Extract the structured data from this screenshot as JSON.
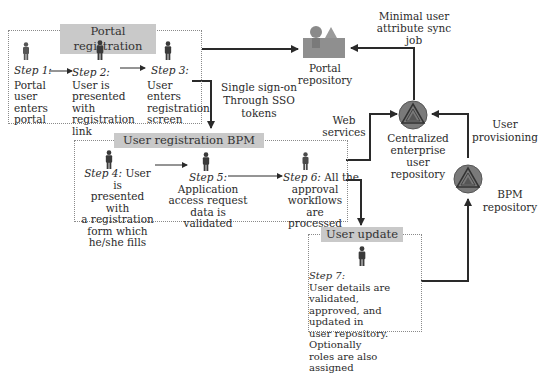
{
  "portal_registration": {
    "title": "Portal registration",
    "steps": [
      {
        "label": "Step 1:",
        "text": [
          "Portal",
          "user",
          "enters",
          "portal"
        ]
      },
      {
        "label": "Step 2:",
        "text": [
          "User is",
          "presented with",
          "registration",
          "link"
        ]
      },
      {
        "label": "Step 3:",
        "text": [
          "User",
          "enters",
          "registration",
          "screen"
        ]
      }
    ]
  },
  "sso": {
    "line1": "Single sign-on",
    "line2": "Through SSO",
    "line3": "tokens"
  },
  "portal_repository": {
    "line1": "Portal",
    "line2": "repository",
    "icon": "portal-repository-icon"
  },
  "sync_job": {
    "line1": "Minimal user",
    "line2": "attribute sync",
    "line3": "job"
  },
  "user_registration_bpm": {
    "title": "User registration BPM",
    "steps": [
      {
        "label": "Step 4:",
        "first": " User is",
        "text": [
          "presented with",
          "a registration",
          "form which",
          "he/she fills"
        ]
      },
      {
        "label": "Step 5:",
        "text": [
          "Application",
          "access request",
          "data is validated"
        ]
      },
      {
        "label": "Step 6:",
        "first": " All the",
        "text": [
          "approval",
          "workflows are",
          "processed"
        ]
      }
    ]
  },
  "web_services": {
    "line1": "Web",
    "line2": "services"
  },
  "central_repo": {
    "line1": "Centralized",
    "line2": "enterprise user",
    "line3": "repository",
    "icon": "enterprise-repository-icon"
  },
  "user_provisioning": {
    "line1": "User",
    "line2": "provisioning"
  },
  "bpm_repo": {
    "line1": "BPM",
    "line2": "repository",
    "icon": "bpm-repository-icon"
  },
  "user_update": {
    "title": "User update",
    "step": {
      "label": "Step 7:",
      "text": [
        "User details are validated,",
        "approved, and updated in",
        "user repository. Optionally",
        "roles are also assigned"
      ]
    }
  },
  "colors": {
    "header_fill": "#c9c9c9",
    "arrow": "#2a2a2a",
    "repo_icon": "#7a7a7a"
  }
}
